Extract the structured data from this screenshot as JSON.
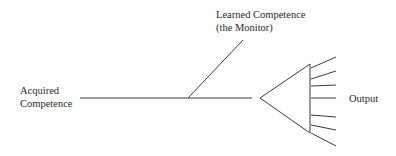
{
  "diagram": {
    "type": "monitor-model",
    "labels": {
      "acquired_line1": "Acquired",
      "acquired_line2": "Competence",
      "learned_line1": "Learned Competence",
      "learned_line2": "(the Monitor)",
      "output": "Output"
    },
    "colors": {
      "line": "#3a3a3a",
      "text": "#2a2a2a",
      "background": "#ffffff"
    },
    "output_ray_count": 7
  }
}
